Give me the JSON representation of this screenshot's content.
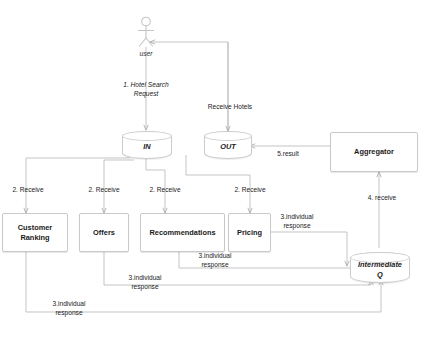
{
  "diagram": {
    "actor": {
      "name": "user",
      "icon": "stick-figure-actor-icon"
    },
    "datastores": [
      {
        "id": "in",
        "label": "IN"
      },
      {
        "id": "out",
        "label": "OUT"
      },
      {
        "id": "intermediate_q",
        "label_line1": "Intermediate",
        "label_line2": "Q"
      }
    ],
    "services": [
      {
        "id": "customer-ranking",
        "line1": "Customer",
        "line2": "Ranking"
      },
      {
        "id": "offers",
        "line1": "Offers",
        "line2": ""
      },
      {
        "id": "recommendations",
        "line1": "Recommendations",
        "line2": ""
      },
      {
        "id": "pricing",
        "line1": "Pricing",
        "line2": ""
      }
    ],
    "aggregator": {
      "id": "aggregator",
      "label": "Aggregator"
    },
    "edge_labels": {
      "hotel_search_request_l1": "1. Hotel Search",
      "hotel_search_request_l2": "Request",
      "receive_hotels": "Receive Hotels",
      "result": "5.result",
      "receive_aggregator": "4. receive",
      "receive_1": "2. Receive",
      "receive_2": "2. Receive",
      "receive_3": "2. Receive",
      "receive_4": "2. Receive",
      "individual_response_l1": "3.individual",
      "individual_response_l2": "response"
    },
    "colors": {
      "background": "#ffffff",
      "node_border": "#c9c9c9",
      "wire": "#b8b8b8",
      "text": "#1a1a1a",
      "label_text": "#222222"
    }
  }
}
